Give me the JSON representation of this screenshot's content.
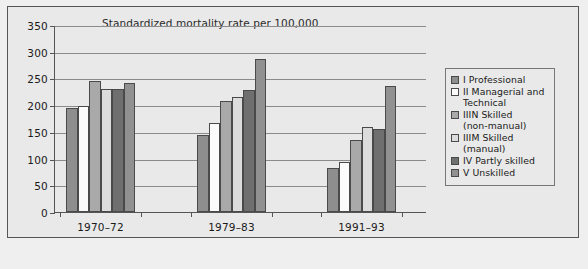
{
  "chart_data": {
    "type": "bar",
    "title": "Standardized mortality rate per 100,000",
    "xlabel": "",
    "ylabel": "",
    "ylim": [
      0,
      350
    ],
    "yticks": [
      0,
      50,
      100,
      150,
      200,
      250,
      300,
      350
    ],
    "grid": true,
    "legend_position": "right",
    "categories": [
      "1970–72",
      "1979–83",
      "1991–93"
    ],
    "series": [
      {
        "name": "I Professional",
        "color": "#8e8e8e",
        "values": [
          195,
          144,
          82
        ]
      },
      {
        "name": "II Managerial and Technical",
        "color": "#fbfbfb",
        "values": [
          198,
          166,
          93
        ]
      },
      {
        "name": "IIIN Skilled (non-manual)",
        "color": "#a9a9a9",
        "values": [
          246,
          208,
          135
        ]
      },
      {
        "name": "IIIM Skilled (manual)",
        "color": "#dcdcdc",
        "values": [
          230,
          216,
          160
        ]
      },
      {
        "name": "IV Partly skilled",
        "color": "#6f6f6f",
        "values": [
          230,
          229,
          156
        ]
      },
      {
        "name": "V Unskilled",
        "color": "#919191",
        "values": [
          241,
          287,
          235
        ]
      }
    ]
  },
  "legend": {
    "items": [
      {
        "line1": "I Professional",
        "line2": ""
      },
      {
        "line1": "II Managerial and",
        "line2": "Technical"
      },
      {
        "line1": "IIIN Skilled",
        "line2": "(non-manual)"
      },
      {
        "line1": "IIIM Skilled",
        "line2": "(manual)"
      },
      {
        "line1": "IV Partly skilled",
        "line2": ""
      },
      {
        "line1": "V Unskilled",
        "line2": ""
      }
    ]
  }
}
